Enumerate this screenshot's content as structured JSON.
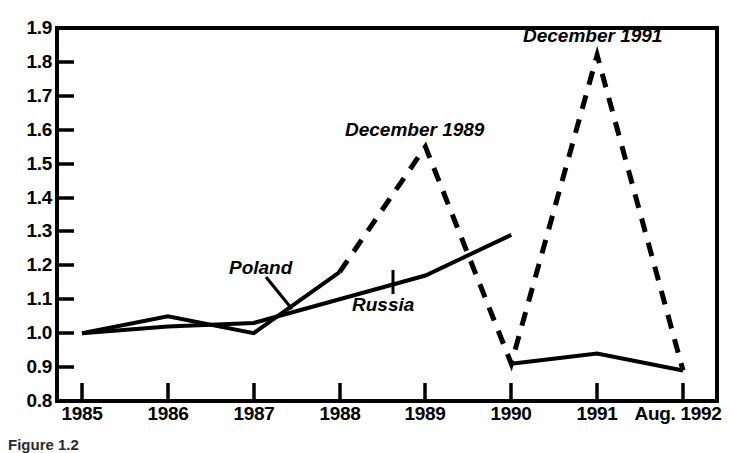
{
  "figure": {
    "caption": "Figure 1.2"
  },
  "chart_data": {
    "type": "line",
    "title": "",
    "subtitle": "",
    "xlabel": "",
    "ylabel": "",
    "categories": [
      "1985",
      "1986",
      "1987",
      "1988",
      "1989",
      "1990",
      "1991",
      "Aug. 1992"
    ],
    "x_tick_labels": [
      "1985",
      "1986",
      "1987",
      "1988",
      "1989",
      "1990",
      "1991",
      "Aug. 1992"
    ],
    "y_tick_labels": [
      "1.9",
      "1.8",
      "1.7",
      "1.6",
      "1.5",
      "1.4",
      "1.3",
      "1.2",
      "1.1",
      "1.0",
      "0.9",
      "0.8"
    ],
    "ylim": [
      0.8,
      1.9
    ],
    "y_tick_step": 0.1,
    "xlim": [
      1985,
      1992
    ],
    "grid": false,
    "legend": "none",
    "series": [
      {
        "name": "Poland",
        "style": "dashed-after-1988",
        "color": "#000000",
        "values": [
          1.0,
          1.05,
          1.0,
          1.18,
          1.55,
          0.91,
          1.82,
          0.89
        ]
      },
      {
        "name": "Russia",
        "style": "solid",
        "color": "#000000",
        "values": [
          1.0,
          1.02,
          1.03,
          1.1,
          1.17,
          1.29,
          0.94,
          0.89
        ]
      }
    ],
    "annotations": [
      {
        "id": "dec-1989",
        "text": "December 1989",
        "points_to": {
          "x": "1989",
          "y": 1.55
        }
      },
      {
        "id": "dec-1991",
        "text": "December 1991",
        "points_to": {
          "x": "1991",
          "y": 1.82
        }
      },
      {
        "id": "poland",
        "text": "Poland",
        "points_to": {
          "x": "1987.2",
          "y": 1.04
        }
      },
      {
        "id": "russia",
        "text": "Russia",
        "points_to": {
          "x": "1988.6",
          "y": 1.14
        }
      }
    ]
  },
  "axis_labels": {
    "y": [
      "1.9",
      "1.8",
      "1.7",
      "1.6",
      "1.5",
      "1.4",
      "1.3",
      "1.2",
      "1.1",
      "1.0",
      "0.9",
      "0.8"
    ],
    "x": [
      "1985",
      "1986",
      "1987",
      "1988",
      "1989",
      "1990",
      "1991",
      "Aug. 1992"
    ]
  },
  "annotation_text": {
    "dec_1989": "December 1989",
    "dec_1991": "December 1991",
    "poland": "Poland",
    "russia": "Russia"
  }
}
